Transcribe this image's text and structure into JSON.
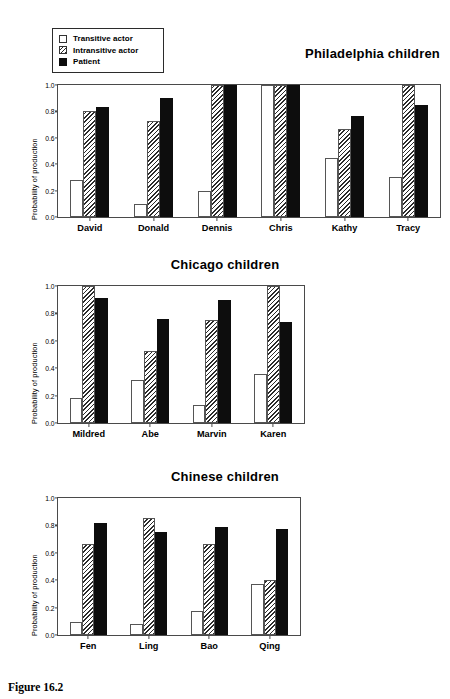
{
  "figure": {
    "caption": "Figure 16.2"
  },
  "axis": {
    "ylabel": "Probability of production",
    "yticks": [
      "0.0",
      "0.2",
      "0.4",
      "0.6",
      "0.8",
      "1.0"
    ]
  },
  "legend": {
    "items": [
      {
        "label": "Transitive actor",
        "style": "open"
      },
      {
        "label": "Intransitive actor",
        "style": "hatched"
      },
      {
        "label": "Patient",
        "style": "solid"
      }
    ]
  },
  "chart_data": [
    {
      "type": "bar",
      "title": "Philadelphia children",
      "title_align": "right",
      "xlabel": "",
      "ylabel": "Probability of production",
      "ylim": [
        0.0,
        1.0
      ],
      "yticks": [
        0.0,
        0.2,
        0.4,
        0.6,
        0.8,
        1.0
      ],
      "grid": false,
      "legend_position": "top-left",
      "categories": [
        "David",
        "Donald",
        "Dennis",
        "Chris",
        "Kathy",
        "Tracy"
      ],
      "series": [
        {
          "name": "Transitive actor",
          "values": [
            0.28,
            0.1,
            0.2,
            1.0,
            0.45,
            0.3
          ]
        },
        {
          "name": "Intransitive actor",
          "values": [
            0.8,
            0.73,
            1.0,
            1.0,
            0.665,
            1.0
          ]
        },
        {
          "name": "Patient",
          "values": [
            0.83,
            0.9,
            1.0,
            1.0,
            0.765,
            0.85
          ]
        }
      ]
    },
    {
      "type": "bar",
      "title": "Chicago children",
      "title_align": "center",
      "xlabel": "",
      "ylabel": "Probability of production",
      "ylim": [
        0.0,
        1.0
      ],
      "yticks": [
        0.0,
        0.2,
        0.4,
        0.6,
        0.8,
        1.0
      ],
      "grid": false,
      "legend_position": "none",
      "categories": [
        "Mildred",
        "Abe",
        "Marvin",
        "Karen"
      ],
      "series": [
        {
          "name": "Transitive actor",
          "values": [
            0.18,
            0.315,
            0.13,
            0.355
          ]
        },
        {
          "name": "Intransitive actor",
          "values": [
            1.0,
            0.525,
            0.75,
            1.0
          ]
        },
        {
          "name": "Patient",
          "values": [
            0.91,
            0.76,
            0.9,
            0.74
          ]
        }
      ]
    },
    {
      "type": "bar",
      "title": "Chinese children",
      "title_align": "center",
      "xlabel": "",
      "ylabel": "Probability of production",
      "ylim": [
        0.0,
        1.0
      ],
      "yticks": [
        0.0,
        0.2,
        0.4,
        0.6,
        0.8,
        1.0
      ],
      "grid": false,
      "legend_position": "none",
      "categories": [
        "Fen",
        "Ling",
        "Bao",
        "Qing"
      ],
      "series": [
        {
          "name": "Transitive actor",
          "values": [
            0.095,
            0.08,
            0.175,
            0.37
          ]
        },
        {
          "name": "Intransitive actor",
          "values": [
            0.665,
            0.855,
            0.665,
            0.4
          ]
        },
        {
          "name": "Patient",
          "values": [
            0.815,
            0.75,
            0.79,
            0.775
          ]
        }
      ]
    }
  ]
}
